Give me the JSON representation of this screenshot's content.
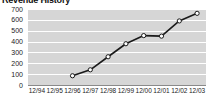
{
  "chart_data": {
    "type": "line",
    "title": "Revenue History",
    "xlabel": "",
    "ylabel": "",
    "categories": [
      "12/94",
      "12/95",
      "12/96",
      "12/97",
      "12/98",
      "12/99",
      "12/00",
      "12/01",
      "12/02",
      "12/03"
    ],
    "series": [
      {
        "name": "Revenue",
        "values": [
          null,
          null,
          85,
          140,
          260,
          380,
          455,
          450,
          590,
          660
        ]
      }
    ],
    "ylim": [
      0,
      700
    ],
    "yticks": [
      0,
      100,
      200,
      300,
      400,
      500,
      600,
      700
    ],
    "ytick_labels": [
      "0",
      "100",
      "200",
      "300",
      "400",
      "500",
      "600",
      "700"
    ],
    "grid": true,
    "legend": "none",
    "marker": "open-circle",
    "colors": {
      "plot_background": "#d6d6d6",
      "gridline": "#ffffff",
      "line": "#1a1a1a",
      "marker_fill": "#ffffff",
      "marker_stroke": "#1a1a1a",
      "text": "#1a1a1a",
      "title": "#111111"
    }
  }
}
